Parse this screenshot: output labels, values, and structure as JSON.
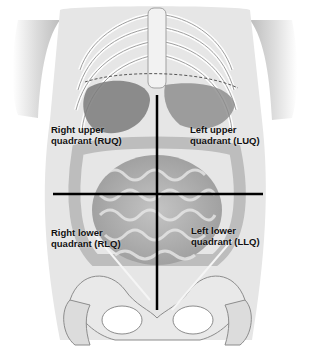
{
  "diagram": {
    "quadrants": [
      {
        "id": "ruq",
        "line1": "Right upper",
        "line2": "quadrant (RUQ)"
      },
      {
        "id": "luq",
        "line1": "Left upper",
        "line2": "quadrant (LUQ)"
      },
      {
        "id": "rlq",
        "line1": "Right lower",
        "line2": "quadrant (RLQ)"
      },
      {
        "id": "llq",
        "line1": "Left lower",
        "line2": "quadrant (LLQ)"
      }
    ],
    "dividers": {
      "vertical": {
        "x": 157,
        "y1": 95,
        "y2": 310
      },
      "horizontal": {
        "y": 194,
        "x1": 53,
        "x2": 263
      }
    },
    "colors": {
      "background": "#ffffff",
      "line": "#000000",
      "text": "#111111",
      "anatomy_light": "#d9d9d9",
      "anatomy_mid": "#a8a8a8",
      "anatomy_dark": "#6e6e6e"
    }
  }
}
